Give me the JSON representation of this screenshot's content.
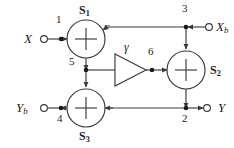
{
  "diagram": {
    "stroke_color": "#3a3a3a",
    "text_color": "#1a1a1a",
    "background": "#ffffff",
    "width": 234,
    "height": 148
  },
  "terminals": [
    {
      "id": "x-in",
      "label": "X",
      "sub": "",
      "side": "left",
      "x": 26,
      "y": 39,
      "marker_x": 48,
      "direction": "in"
    },
    {
      "id": "xb-in",
      "label": "X",
      "sub": "b",
      "side": "right",
      "x": 214,
      "y": 27,
      "marker_x": 205,
      "direction": "in"
    },
    {
      "id": "yb-out",
      "label": "Y",
      "sub": "b",
      "side": "left",
      "x": 21,
      "y": 108,
      "marker_x": 48,
      "direction": "out"
    },
    {
      "id": "y-out",
      "label": "Y",
      "sub": "",
      "side": "right",
      "x": 216,
      "y": 108,
      "marker_x": 205,
      "direction": "out"
    }
  ],
  "adders": [
    {
      "id": "s1",
      "label": "S",
      "sub": "1",
      "cx": 86,
      "cy": 39,
      "r": 19,
      "label_pos": "above"
    },
    {
      "id": "s2",
      "label": "S",
      "sub": "2",
      "cx": 186,
      "cy": 70,
      "r": 19,
      "label_pos": "right"
    },
    {
      "id": "s3",
      "label": "S",
      "sub": "3",
      "cx": 86,
      "cy": 108,
      "r": 19,
      "label_pos": "below"
    }
  ],
  "amplifier": {
    "id": "gamma-gain",
    "label": "γ",
    "x1": 115,
    "x2": 146,
    "cy": 70,
    "half_height": 16,
    "label_x": 126,
    "label_y": 48
  },
  "nodes": [
    {
      "id": "node-1",
      "label": "1",
      "x": 61,
      "y": 39,
      "label_x": 58,
      "label_y": 20
    },
    {
      "id": "node-2",
      "label": "2",
      "x": 186,
      "y": 108,
      "label_x": 183,
      "label_y": 120
    },
    {
      "id": "node-3",
      "label": "3",
      "x": 186,
      "y": 27,
      "label_x": 183,
      "label_y": 8
    },
    {
      "id": "node-4",
      "label": "4",
      "x": 61,
      "y": 108,
      "label_x": 58,
      "label_y": 120
    },
    {
      "id": "node-5",
      "label": "5",
      "x": 86,
      "y": 70,
      "label_x": 72,
      "label_y": 62
    },
    {
      "id": "node-6",
      "label": "6",
      "x": 152,
      "y": 70,
      "label_x": 149,
      "label_y": 52
    }
  ],
  "signs": [
    {
      "id": "s1-minus-input",
      "label": "−",
      "x": 107,
      "y": 28
    }
  ],
  "connections": [
    {
      "id": "x-to-s1",
      "from": "x-in",
      "to": "s1",
      "description": "X input into S1 from left"
    },
    {
      "id": "xb-to-s1",
      "from": "node-3",
      "to": "s1",
      "description": "Xb branch into S1 from right, negative"
    },
    {
      "id": "xb-to-s2",
      "from": "node-3",
      "to": "s2",
      "description": "Xb branch down into S2"
    },
    {
      "id": "s1-to-s3",
      "from": "s1",
      "to": "s3",
      "description": "S1 output down through node 5 into S3"
    },
    {
      "id": "node5-to-amp",
      "from": "node-5",
      "to": "gamma-gain",
      "description": "node 5 branch right into gamma amplifier"
    },
    {
      "id": "amp-to-s2",
      "from": "gamma-gain",
      "to": "s2",
      "description": "gamma output through node 6 into S2"
    },
    {
      "id": "s2-to-y",
      "from": "s2",
      "to": "y-out",
      "description": "S2 output down to node 2 then right to Y"
    },
    {
      "id": "node2-to-s3",
      "from": "node-2",
      "to": "s3",
      "description": "node 2 feedback left into S3"
    },
    {
      "id": "s3-to-yb",
      "from": "s3",
      "to": "yb-out",
      "description": "S3 output left through node 4 to Yb"
    }
  ]
}
